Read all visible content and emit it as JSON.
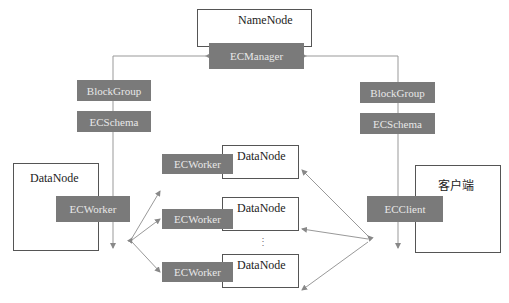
{
  "namenode": {
    "label": "NameNode",
    "component": "ECManager"
  },
  "left_path": {
    "tags": [
      "BlockGroup",
      "ECSchema"
    ]
  },
  "right_path": {
    "tags": [
      "BlockGroup",
      "ECSchema"
    ]
  },
  "main_datanode": {
    "label": "DataNode",
    "component": "ECWorker"
  },
  "client": {
    "label": "客户端",
    "component": "ECClient"
  },
  "worker_datanodes": [
    {
      "label": "DataNode",
      "component": "ECWorker"
    },
    {
      "label": "DataNode",
      "component": "ECWorker"
    },
    {
      "label": "DataNode",
      "component": "ECWorker"
    }
  ],
  "ellipsis": "⋮",
  "colors": {
    "tag_fill": "#7a7a7a",
    "tag_text": "#e8e8e8",
    "line": "#888888",
    "border": "#555555"
  }
}
